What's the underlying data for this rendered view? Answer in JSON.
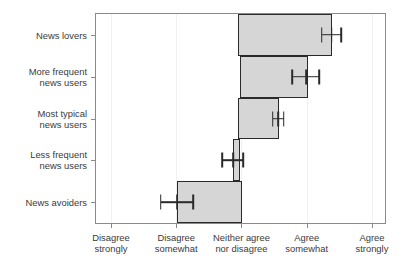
{
  "chart_data": {
    "type": "bar",
    "orientation": "horizontal",
    "title": "",
    "xlabel": "",
    "ylabel": "",
    "categories": [
      "News lovers",
      "More frequent\nnews users",
      "Most typical\nnews users",
      "Less frequent\nnews users",
      "News avoiders"
    ],
    "category_lines": [
      [
        "News lovers"
      ],
      [
        "More frequent",
        "news users"
      ],
      [
        "Most typical",
        "news users"
      ],
      [
        "Less frequent",
        "news users"
      ],
      [
        "News avoiders"
      ]
    ],
    "values": [
      4.39,
      4.02,
      3.57,
      2.97,
      3.01
    ],
    "bar_starts": [
      2.95,
      2.98,
      2.95,
      2.87,
      2.01
    ],
    "bar_ends": [
      4.39,
      4.02,
      3.57,
      2.97,
      3.01
    ],
    "error_centers": [
      4.38,
      3.99,
      3.56,
      2.87,
      2.01
    ],
    "error_low": [
      4.23,
      3.78,
      3.48,
      2.7,
      1.76
    ],
    "error_high": [
      4.53,
      4.19,
      3.65,
      3.03,
      2.26
    ],
    "xlim": [
      0.77,
      5.2
    ],
    "xticks": [
      1,
      2,
      3,
      4,
      5
    ],
    "xticklabels": [
      "Disagree\nstrongly",
      "Disagree\nsomewhat",
      "Neither agree\nnor disagree",
      "Agree\nsomewhat",
      "Agree\nstrongly"
    ],
    "xticklabel_lines": [
      [
        "Disagree",
        "strongly"
      ],
      [
        "Disagree",
        "somewhat"
      ],
      [
        "Neither agree",
        "nor disagree"
      ],
      [
        "Agree",
        "somewhat"
      ],
      [
        "Agree",
        "strongly"
      ]
    ],
    "grid": true,
    "grid_axis": "x",
    "legend": null,
    "legend_position": "none",
    "colors": {
      "bar_fill": "#d6d6d6",
      "bar_edge": "#2a2a2a",
      "error_bar": "#2a2a2a",
      "frame": "#8a8a8a",
      "grid": "#f0f0f0",
      "text": "#3a3a3a",
      "background": "#ffffff"
    }
  }
}
